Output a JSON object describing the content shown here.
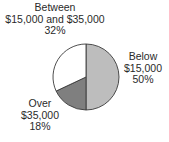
{
  "chart_data": {
    "type": "pie",
    "title": "",
    "categories": [
      "Below $15,000",
      "Over $35,000",
      "Between $15,000 and $35,000"
    ],
    "values": [
      50,
      18,
      32
    ],
    "unit": "%",
    "colors": [
      "#bdbdbd",
      "#7f7f7f",
      "#ffffff"
    ],
    "start_angle": "12 o'clock",
    "direction": "clockwise",
    "legend": "none (direct labels)"
  },
  "labels": {
    "between": {
      "line1": "Between",
      "line2": "$15,000 and $35,000",
      "pct": "32%"
    },
    "below": {
      "line1": "Below",
      "line2": "$15,000",
      "pct": "50%"
    },
    "over": {
      "line1": "Over",
      "line2": "$35,000",
      "pct": "18%"
    }
  }
}
